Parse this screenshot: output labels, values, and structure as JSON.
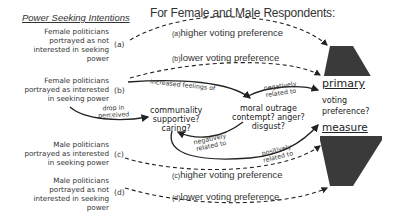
{
  "diagram": {
    "left_title": "Power Seeking Intentions",
    "right_title": "For Female and Male Respondents:",
    "conditions": [
      {
        "id": "a",
        "tag": "(a)",
        "lines": [
          "Female politicians",
          "portrayed as not",
          "interested in seeking",
          "power"
        ]
      },
      {
        "id": "b",
        "tag": "(b)",
        "lines": [
          "Female politicians",
          "portrayed as interested",
          "in seeking power"
        ]
      },
      {
        "id": "c",
        "tag": "(c)",
        "lines": [
          "Male politicians",
          "portrayed as interested",
          "in seeking power"
        ]
      },
      {
        "id": "d",
        "tag": "(d)",
        "lines": [
          "Male politicians",
          "portrayed as not",
          "interested in seeking",
          "power"
        ]
      }
    ],
    "outcomes": [
      {
        "id": "a",
        "tag": "(a)",
        "label": "higher voting preference"
      },
      {
        "id": "b",
        "tag": "(b)",
        "label": "lower voting preference"
      },
      {
        "id": "c",
        "tag": "(c)",
        "label": "higher voting preference"
      },
      {
        "id": "d",
        "tag": "(d)",
        "label": "lower voting preference"
      }
    ],
    "nodes": {
      "communality": [
        "communality",
        "supportive?",
        "caring?"
      ],
      "moral_outrage": [
        "moral outrage",
        "contempt? anger?",
        "disgust?"
      ]
    },
    "edges": {
      "drop_in_perceived": [
        "drop in",
        "perceived"
      ],
      "increased_feelings_of": "increased feelings of",
      "outrage_to_measure": [
        "negatively",
        "related to"
      ],
      "communality_to_outrage": [
        "negatively",
        "related to"
      ],
      "communality_to_measure": [
        "positively",
        "related to"
      ]
    },
    "measure": {
      "top": "primary",
      "middle": [
        "voting",
        "preference?"
      ],
      "bottom": "measure"
    },
    "colors": {
      "shape_fill": "#3a3a3a",
      "line": "#222222",
      "text": "#333333"
    }
  }
}
